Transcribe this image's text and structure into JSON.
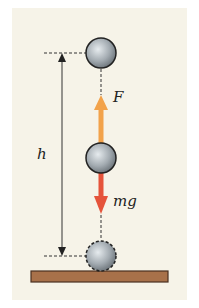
{
  "diagram": {
    "labels": {
      "height": "h",
      "force": "F",
      "weight": "mg"
    },
    "colors": {
      "background": "#f6f3e8",
      "force_arrow": "#f2a24a",
      "weight_arrow": "#e5533a",
      "ground": "#a8714a",
      "ball": "#9aa3aa"
    },
    "elements": [
      "ball-top",
      "ball-middle",
      "ball-bottom-dashed",
      "force-arrow-up",
      "weight-arrow-down",
      "height-dimension",
      "ground"
    ]
  }
}
